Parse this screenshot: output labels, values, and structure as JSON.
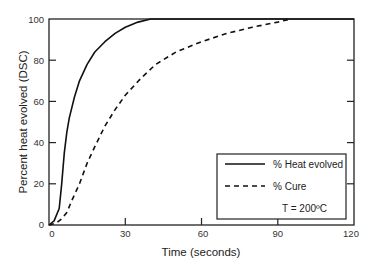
{
  "chart_data": {
    "type": "line",
    "title": "",
    "xlabel": "Time (seconds)",
    "ylabel": "Percent heat evolved (DSC)",
    "xlim": [
      0,
      120
    ],
    "ylim": [
      0,
      100
    ],
    "xticks": [
      "0",
      "30",
      "60",
      "90",
      "120"
    ],
    "yticks": [
      "0",
      "20",
      "40",
      "60",
      "80",
      "100"
    ],
    "grid": false,
    "legend_position": "lower right",
    "annotation": "T = 200ºC",
    "series": [
      {
        "name": "% Heat evolved",
        "style": "solid",
        "x": [
          0,
          2,
          4,
          5,
          6,
          7,
          8,
          10,
          12,
          15,
          18,
          22,
          26,
          30,
          35,
          40,
          120
        ],
        "y": [
          0,
          2,
          8,
          20,
          35,
          45,
          52,
          62,
          70,
          78,
          84,
          89,
          93,
          96,
          98.5,
          100,
          100
        ]
      },
      {
        "name": "% Cure",
        "style": "dashed",
        "x": [
          0,
          3,
          5,
          7,
          9,
          12,
          15,
          18,
          22,
          26,
          30,
          36,
          42,
          50,
          60,
          70,
          80,
          90,
          95
        ],
        "y": [
          0,
          1,
          3,
          6,
          12,
          20,
          30,
          38,
          48,
          56,
          63,
          71,
          78,
          84,
          89,
          93,
          96,
          98.5,
          100
        ]
      }
    ]
  },
  "labels": {
    "xlabel": "Time (seconds)",
    "ylabel": "Percent heat evolved (DSC)",
    "legend_heat": "% Heat evolved",
    "legend_cure": "% Cure",
    "annotation": "T = 200ºC",
    "xtick_0": "0",
    "xtick_30": "30",
    "xtick_60": "60",
    "xtick_90": "90",
    "xtick_120": "120",
    "ytick_0": "0",
    "ytick_20": "20",
    "ytick_40": "40",
    "ytick_60": "60",
    "ytick_80": "80",
    "ytick_100": "100"
  }
}
